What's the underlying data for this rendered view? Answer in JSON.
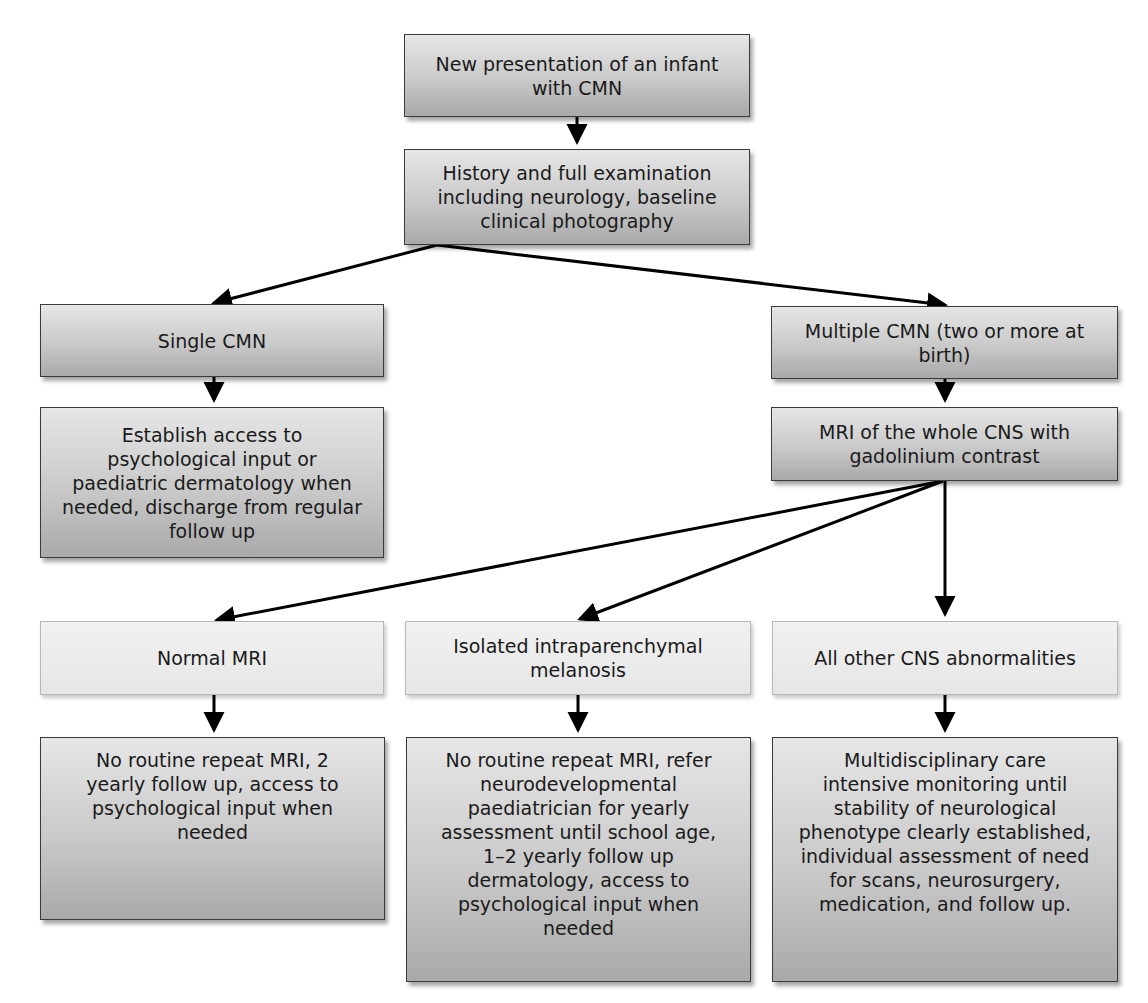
{
  "diagram": {
    "type": "flowchart",
    "nodes": {
      "start": "New presentation of an infant\nwith CMN",
      "history": "History and full examination\nincluding neurology, baseline\nclinical photography",
      "single": "Single CMN",
      "single_action": "Establish access to\npsychological input or\npaediatric dermatology when\nneeded, discharge from regular\nfollow up",
      "multiple": "Multiple CMN (two or more at\nbirth)",
      "mri": "MRI of the whole CNS with\ngadolinium contrast",
      "normal": "Normal MRI",
      "isolated": "Isolated intraparenchymal\nmelanosis",
      "other": "All other CNS abnormalities",
      "normal_action": "No routine repeat MRI, 2\nyearly follow up, access to\npsychological input when\nneeded",
      "isolated_action": "No routine repeat MRI, refer\nneurodevelopmental\npaediatrician for yearly\nassessment until school age,\n1–2 yearly follow up\ndermatology, access to\npsychological input when\nneeded",
      "other_action": "Multidisciplinary care\nintensive monitoring until\nstability of neurological\nphenotype clearly established,\nindividual assessment of need\nfor scans, neurosurgery,\nmedication, and follow up."
    },
    "edges": [
      [
        "start",
        "history"
      ],
      [
        "history",
        "single"
      ],
      [
        "history",
        "multiple"
      ],
      [
        "single",
        "single_action"
      ],
      [
        "multiple",
        "mri"
      ],
      [
        "mri",
        "normal"
      ],
      [
        "mri",
        "isolated"
      ],
      [
        "mri",
        "other"
      ],
      [
        "normal",
        "normal_action"
      ],
      [
        "isolated",
        "isolated_action"
      ],
      [
        "other",
        "other_action"
      ]
    ],
    "colors": {
      "dark_box_top": "#e6e6e6",
      "dark_box_bottom": "#a9a9a9",
      "light_box": "#ececec",
      "arrow": "#000000"
    }
  }
}
